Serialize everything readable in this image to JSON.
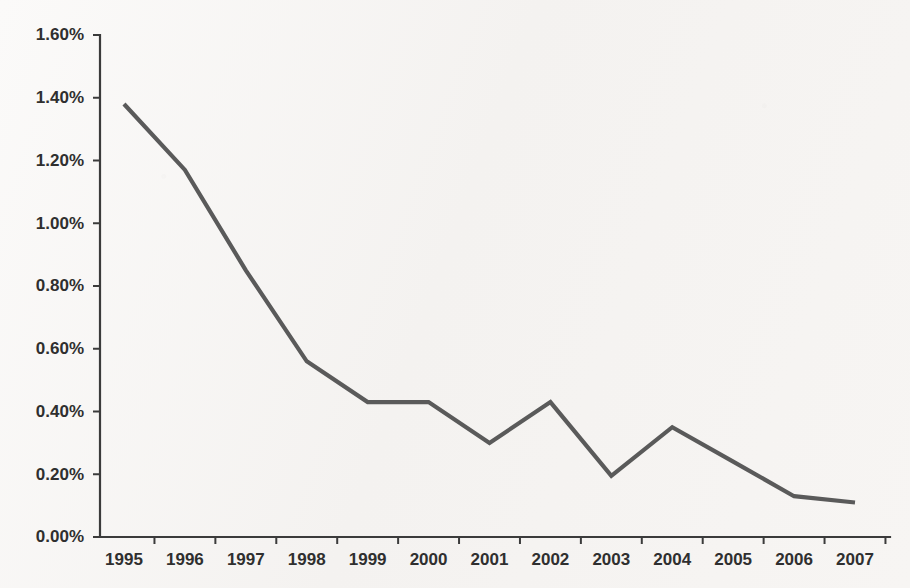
{
  "chart_data": {
    "type": "line",
    "title": "",
    "subtitle": "",
    "xlabel": "",
    "ylabel": "",
    "x": [
      "1995",
      "1996",
      "1997",
      "1998",
      "1999",
      "2000",
      "2001",
      "2002",
      "2003",
      "2004",
      "2005",
      "2006",
      "2007"
    ],
    "categories": [
      "1995",
      "1996",
      "1997",
      "1998",
      "1999",
      "2000",
      "2001",
      "2002",
      "2003",
      "2004",
      "2005",
      "2006",
      "2007"
    ],
    "values": [
      1.38,
      1.17,
      0.85,
      0.56,
      0.43,
      0.43,
      0.3,
      0.43,
      0.195,
      0.35,
      0.24,
      0.13,
      0.11
    ],
    "series": [
      {
        "name": "",
        "values": [
          1.38,
          1.17,
          0.85,
          0.56,
          0.43,
          0.43,
          0.3,
          0.43,
          0.195,
          0.35,
          0.24,
          0.13,
          0.11
        ]
      }
    ],
    "ylim": [
      0.0,
      1.6
    ],
    "ytick_values": [
      0.0,
      0.2,
      0.4,
      0.6,
      0.8,
      1.0,
      1.2,
      1.4,
      1.6
    ],
    "ytick_labels": [
      "0.00%",
      "0.20%",
      "0.40%",
      "0.60%",
      "0.80%",
      "1.00%",
      "1.20%",
      "1.40%",
      "1.60%"
    ],
    "xtick_labels": [
      "1995",
      "1996",
      "1997",
      "1998",
      "1999",
      "2000",
      "2001",
      "2002",
      "2003",
      "2004",
      "2005",
      "2006",
      "2007"
    ],
    "grid": false,
    "legend": false,
    "legend_position": "none",
    "value_suffix": "%",
    "annotations": []
  },
  "style": {
    "line_color": "#5a5a5a",
    "axis_color": "#3b3b3b",
    "text_color": "#2f2f2f",
    "background_color": "#f4f2f0"
  },
  "geometry": {
    "plot_left": 100,
    "plot_right": 890,
    "plot_top": 35,
    "plot_bottom": 537,
    "first_point_x": 124,
    "last_point_x": 855
  }
}
